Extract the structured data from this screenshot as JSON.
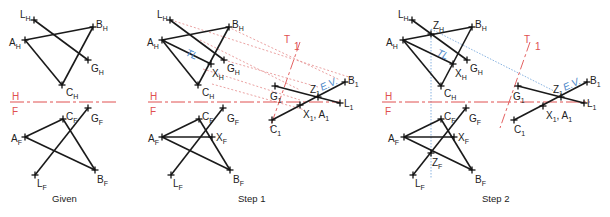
{
  "figure": {
    "panels": [
      {
        "caption": "Given",
        "top_view_points": [
          "L_H",
          "B_H",
          "A_H",
          "G_H",
          "C_H"
        ],
        "front_view_points": [
          "C_F",
          "G_F",
          "A_F",
          "B_F",
          "L_F"
        ]
      },
      {
        "caption": "Step 1",
        "top_view_points": [
          "L_H",
          "B_H",
          "A_H",
          "X_H",
          "G_H",
          "C_H"
        ],
        "front_view_points": [
          "C_F",
          "G_F",
          "A_F",
          "X_F",
          "B_F",
          "L_F"
        ],
        "auxiliary_points": [
          "B_1",
          "Z_1",
          "G_1",
          "L_1",
          "X_1, A_1",
          "C_1"
        ],
        "annotations": [
          "TL",
          "E.V.",
          "T",
          "1"
        ]
      },
      {
        "caption": "Step 2",
        "top_view_points": [
          "L_H",
          "Z_H",
          "B_H",
          "A_H",
          "X_H",
          "G_H",
          "C_H"
        ],
        "front_view_points": [
          "C_F",
          "G_F",
          "A_F",
          "X_F",
          "Z_F",
          "B_F",
          "L_F"
        ],
        "auxiliary_points": [
          "B_1",
          "Z_1",
          "G_1",
          "L_1",
          "X_1, A_1",
          "C_1"
        ],
        "annotations": [
          "TL",
          "E.V.",
          "T",
          "1"
        ]
      }
    ],
    "fold_line_labels": {
      "upper": "H",
      "lower": "F"
    },
    "colors": {
      "lines": "#1a1a1a",
      "fold_line": "#e05050",
      "projection": "#e58a8a",
      "true_length": "#4a86c8"
    },
    "labels": {
      "given": "Given",
      "step1": "Step 1",
      "step2": "Step 2",
      "H": "H",
      "F": "F",
      "T": "T",
      "one": "1",
      "TL": "TL",
      "EV": "E.V.",
      "L": "L",
      "B": "B",
      "A": "A",
      "G": "G",
      "C": "C",
      "X": "X",
      "Z": "Z",
      "sH": "H",
      "sF": "F",
      "s1": "1",
      "XA": "X",
      "XA_sep": ", A"
    }
  }
}
